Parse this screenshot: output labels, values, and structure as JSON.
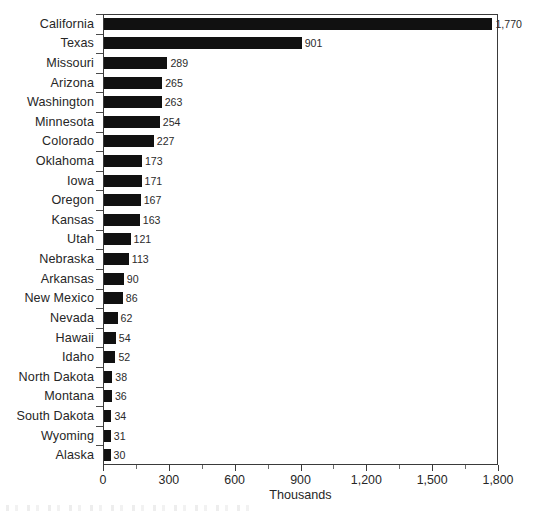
{
  "chart_data": {
    "type": "bar",
    "orientation": "horizontal",
    "title": "",
    "subtitle": "",
    "xlabel": "Thousands",
    "ylabel": "",
    "xlim": [
      0,
      1800
    ],
    "xticks": [
      0,
      300,
      600,
      900,
      1200,
      1500,
      1800
    ],
    "xtick_labels": [
      "0",
      "300",
      "600",
      "900",
      "1,200",
      "1,500",
      "1,800"
    ],
    "xminor_ticks": [
      150,
      450,
      750,
      1050,
      1350,
      1650
    ],
    "grid": false,
    "legend": null,
    "bar_color": "#111111",
    "axis_color": "#3a3a3a",
    "categories": [
      "California",
      "Texas",
      "Missouri",
      "Arizona",
      "Washington",
      "Minnesota",
      "Colorado",
      "Oklahoma",
      "Iowa",
      "Oregon",
      "Kansas",
      "Utah",
      "Nebraska",
      "Arkansas",
      "New Mexico",
      "Nevada",
      "Hawaii",
      "Idaho",
      "North Dakota",
      "Montana",
      "South Dakota",
      "Wyoming",
      "Alaska"
    ],
    "values": [
      1770,
      901,
      289,
      265,
      263,
      254,
      227,
      173,
      171,
      167,
      163,
      121,
      113,
      90,
      86,
      62,
      54,
      52,
      38,
      36,
      34,
      31,
      30
    ],
    "value_labels": [
      "1,770",
      "901",
      "289",
      "265",
      "263",
      "254",
      "227",
      "173",
      "171",
      "167",
      "163",
      "121",
      "113",
      "90",
      "86",
      "62",
      "54",
      "52",
      "38",
      "36",
      "34",
      "31",
      "30"
    ]
  }
}
